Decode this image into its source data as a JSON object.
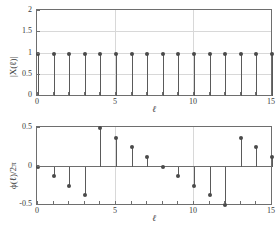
{
  "chart_data": [
    {
      "type": "stem",
      "panel": "top",
      "title": "",
      "xlabel": "ℓ",
      "ylabel": "|X(ℓ)|",
      "x": [
        0,
        1,
        2,
        3,
        4,
        5,
        6,
        7,
        8,
        9,
        10,
        11,
        12,
        13,
        14,
        15
      ],
      "values": [
        1,
        1,
        1,
        1,
        1,
        1,
        1,
        1,
        1,
        1,
        1,
        1,
        1,
        1,
        1,
        1
      ],
      "xlim": [
        0,
        15
      ],
      "ylim": [
        0,
        2
      ],
      "xticks": [
        0,
        5,
        10,
        15
      ],
      "xticklabels": [
        "0",
        "5",
        "10",
        "15"
      ],
      "xminorticks": [
        1,
        2,
        3,
        4,
        6,
        7,
        8,
        9,
        11,
        12,
        13,
        14
      ],
      "yticks": [
        0,
        0.5,
        1,
        1.5,
        2
      ],
      "yticklabels": [
        "0",
        "0.5",
        "1",
        "1.5",
        "2"
      ],
      "grid": true,
      "legend": null
    },
    {
      "type": "stem",
      "panel": "bottom",
      "title": "",
      "xlabel": "ℓ",
      "ylabel": "ϕ(ℓ)/2π",
      "x": [
        0,
        1,
        2,
        3,
        4,
        5,
        6,
        7,
        8,
        9,
        10,
        11,
        12,
        13,
        14,
        15
      ],
      "values": [
        0,
        -0.125,
        -0.25,
        -0.375,
        0.5,
        0.375,
        0.25,
        0.125,
        0,
        -0.125,
        -0.25,
        -0.375,
        -0.5,
        0.375,
        0.25,
        0.125
      ],
      "xlim": [
        0,
        15
      ],
      "ylim": [
        -0.5,
        0.5
      ],
      "xticks": [
        0,
        5,
        10,
        15
      ],
      "xticklabels": [
        "0",
        "5",
        "10",
        "15"
      ],
      "xminorticks": [
        1,
        2,
        3,
        4,
        6,
        7,
        8,
        9,
        11,
        12,
        13,
        14
      ],
      "yticks": [
        -0.5,
        0,
        0.5
      ],
      "yticklabels": [
        "-0.5",
        "0",
        "0.5"
      ],
      "grid": true,
      "legend": null
    }
  ],
  "figure": {
    "background_color": "#ffffff",
    "axis_color": "#6e6e6e",
    "marker_color": "#4a4a4a",
    "stem_color": "#5a5a5a",
    "grid_color": "#d8d8d8"
  }
}
